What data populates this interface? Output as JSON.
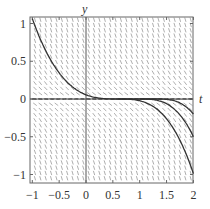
{
  "chart_data": {
    "type": "line",
    "subtype": "slope-field",
    "title": "",
    "xlabel": "t",
    "ylabel": "y",
    "xlim": [
      -1,
      2.05
    ],
    "ylim": [
      -1.08,
      1.1
    ],
    "x_ticks": [
      -1,
      -0.5,
      0,
      0.5,
      1,
      1.5,
      2
    ],
    "x_tick_labels": [
      "−1",
      "−0.5",
      "0",
      "0.5",
      "1",
      "1.5",
      "2"
    ],
    "y_ticks": [
      -1,
      -0.5,
      0,
      0.5,
      1
    ],
    "y_tick_labels": [
      "−1",
      "−0.5",
      "0",
      "0.5",
      "1"
    ],
    "grid": false,
    "legend": null,
    "slope_field": {
      "direction": "negative slopes, flattening near y = 0",
      "color": "#888888"
    },
    "series": [
      {
        "name": "solution-main",
        "points": [
          [
            -1,
            1.07
          ],
          [
            -0.75,
            0.71
          ],
          [
            -0.5,
            0.38
          ],
          [
            -0.25,
            0.16
          ],
          [
            0,
            0.06
          ],
          [
            0.3,
            0.01
          ],
          [
            0.6,
            0
          ],
          [
            0.9,
            -0.01
          ],
          [
            1.2,
            -0.08
          ],
          [
            1.5,
            -0.26
          ],
          [
            1.75,
            -0.55
          ],
          [
            2,
            -0.99
          ]
        ]
      },
      {
        "name": "solution-2",
        "points": [
          [
            0.6,
            0
          ],
          [
            1,
            0
          ],
          [
            1.25,
            -0.01
          ],
          [
            1.5,
            -0.06
          ],
          [
            1.75,
            -0.21
          ],
          [
            2,
            -0.5
          ]
        ]
      },
      {
        "name": "solution-3",
        "points": [
          [
            1,
            0
          ],
          [
            1.3,
            0
          ],
          [
            1.5,
            -0.005
          ],
          [
            1.75,
            -0.05
          ],
          [
            2,
            -0.2
          ]
        ]
      },
      {
        "name": "solution-zero",
        "points": [
          [
            -1,
            0
          ],
          [
            2,
            0
          ]
        ]
      }
    ],
    "colors": {
      "curve": "#333333",
      "field": "#999999",
      "axis": "#555555"
    }
  }
}
